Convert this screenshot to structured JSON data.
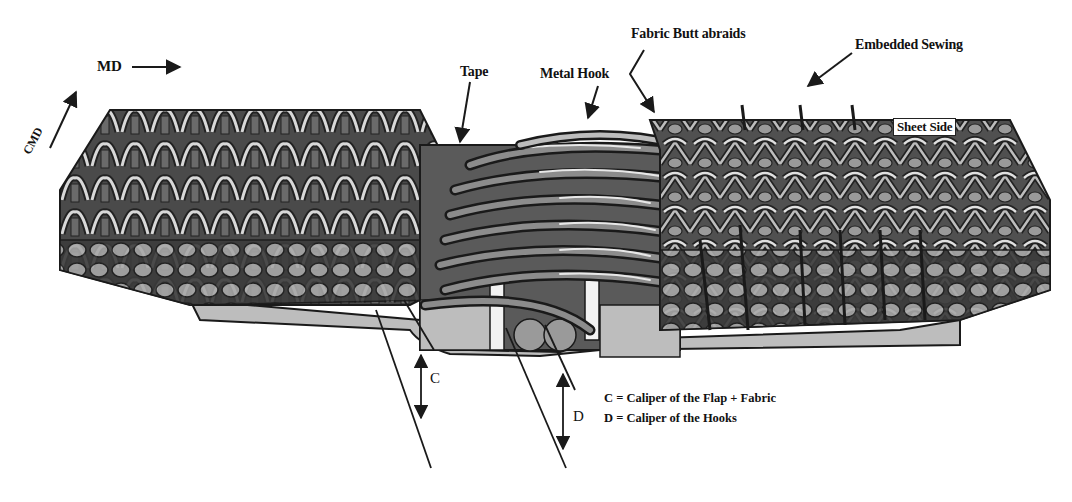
{
  "diagram": {
    "orientation": {
      "md_label": "MD",
      "cmd_label": "CMD"
    },
    "callouts": {
      "tape": "Tape",
      "metal_hook": "Metal Hook",
      "fabric_butt": "Fabric Butt abraids",
      "embedded_sewing": "Embedded Sewing",
      "sheet_side": "Sheet Side"
    },
    "dimensions": {
      "c_label": "C",
      "d_label": "D"
    },
    "legend": {
      "c_def": "C = Caliper of the Flap + Fabric",
      "d_def": "D = Caliper of the Hooks"
    },
    "colors": {
      "fabric_dark": "#3a3a3a",
      "fabric_mid": "#6e6e6e",
      "fabric_light": "#cfcfcf",
      "tape": "#5a5a5a",
      "flap": "#b8b8b8",
      "line": "#1a1a1a"
    }
  }
}
